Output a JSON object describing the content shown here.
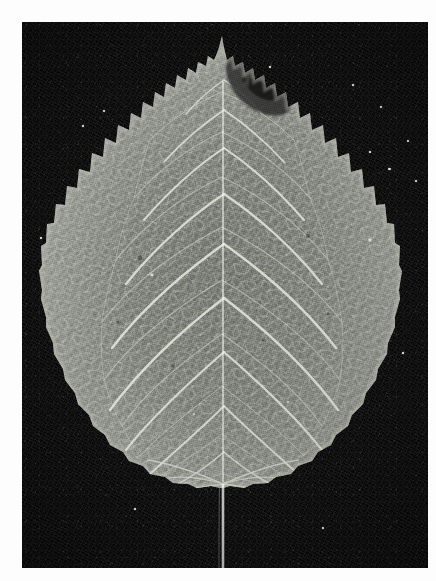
{
  "image": {
    "domain": "Natural-Image",
    "subject": "leaf",
    "description": "Black and white photograph of a single broad ovate leaf with serrated margins, photographed against a black background",
    "medium": "monochrome photographic print",
    "caption": "",
    "canvas": {
      "width": 436,
      "height": 581
    },
    "plate": {
      "x": 22,
      "y": 22,
      "width": 406,
      "height": 546
    },
    "border_color": "#ffffff",
    "background_color": "#0a0a0a"
  },
  "palette": {
    "page_white": "#ffffff",
    "background_black": "#0a0a0a",
    "leaf_mid_gray": "#808080",
    "leaf_light_gray": "#a0a29c",
    "leaf_dark_gray": "#5a5c58",
    "vein_highlight": "#d2d6cc",
    "midrib_white": "#eceee8",
    "petiole_white": "#f2f2ee",
    "damage_dark": "#2a2a28"
  },
  "subject_features": [
    {
      "name": "leaf-apex",
      "label": "Apex (acuminate tip)",
      "x": 222,
      "y": 36
    },
    {
      "name": "leaf-base",
      "label": "Base (subcordate)",
      "x": 222,
      "y": 487
    },
    {
      "name": "leaf-widest-left",
      "label": "Widest point, left margin",
      "x": 44,
      "y": 345
    },
    {
      "name": "leaf-widest-right",
      "label": "Widest point, right margin",
      "x": 414,
      "y": 338
    },
    {
      "name": "midrib",
      "label": "Midrib / primary vein",
      "x": 223,
      "y": 260
    },
    {
      "name": "petiole",
      "label": "Petiole (leaf stalk)",
      "x": 223,
      "y": 528
    },
    {
      "name": "damage-patch",
      "label": "Dark damaged patch near apex",
      "x": 262,
      "y": 80
    }
  ],
  "measurements": {
    "leaf_height_px": 452,
    "leaf_width_px": 370,
    "petiole_length_px": 81,
    "lateral_vein_pairs": 9,
    "margin_type": "serrate",
    "venation_type": "pinnate-reticulate"
  }
}
